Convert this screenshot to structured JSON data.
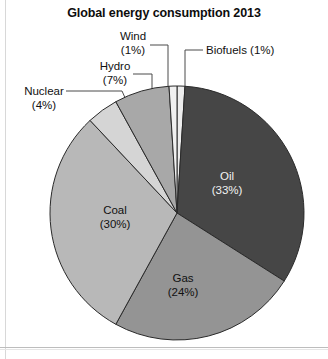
{
  "page": {
    "background": "#ffffff",
    "border_color": "#bdbdbd"
  },
  "chart_data": {
    "type": "pie",
    "title": "Global energy consumption 2013",
    "xlabel": "",
    "ylabel": "",
    "legend_position": "none",
    "grid": false,
    "unit": "%",
    "start_angle_deg": 0,
    "direction": "clockwise",
    "categories": [
      "Biofuels",
      "Oil",
      "Gas",
      "Coal",
      "Nuclear",
      "Hydro",
      "Wind"
    ],
    "values": [
      1,
      33,
      24,
      30,
      4,
      7,
      1
    ],
    "slices": [
      {
        "name": "Biofuels",
        "label": "Biofuels (1%)",
        "name_text": "Biofuels",
        "pct_text": "(1%)",
        "value": 1,
        "color": "#ededed",
        "label_placement": "outside"
      },
      {
        "name": "Oil",
        "label": "Oil (33%)",
        "name_text": "Oil",
        "pct_text": "(33%)",
        "value": 33,
        "color": "#464646",
        "label_placement": "inside"
      },
      {
        "name": "Gas",
        "label": "Gas (24%)",
        "name_text": "Gas",
        "pct_text": "(24%)",
        "value": 24,
        "color": "#949494",
        "label_placement": "inside"
      },
      {
        "name": "Coal",
        "label": "Coal (30%)",
        "name_text": "Coal",
        "pct_text": "(30%)",
        "value": 30,
        "color": "#b8b8b8",
        "label_placement": "inside"
      },
      {
        "name": "Nuclear",
        "label": "Nuclear (4%)",
        "name_text": "Nuclear",
        "pct_text": "(4%)",
        "value": 4,
        "color": "#d5d5d5",
        "label_placement": "outside"
      },
      {
        "name": "Hydro",
        "label": "Hydro (7%)",
        "name_text": "Hydro",
        "pct_text": "(7%)",
        "value": 7,
        "color": "#a8a8a8",
        "label_placement": "outside"
      },
      {
        "name": "Wind",
        "label": "Wind (1%)",
        "name_text": "Wind",
        "pct_text": "(1%)",
        "value": 1,
        "color": "#f0f0f0",
        "label_placement": "outside"
      }
    ]
  }
}
